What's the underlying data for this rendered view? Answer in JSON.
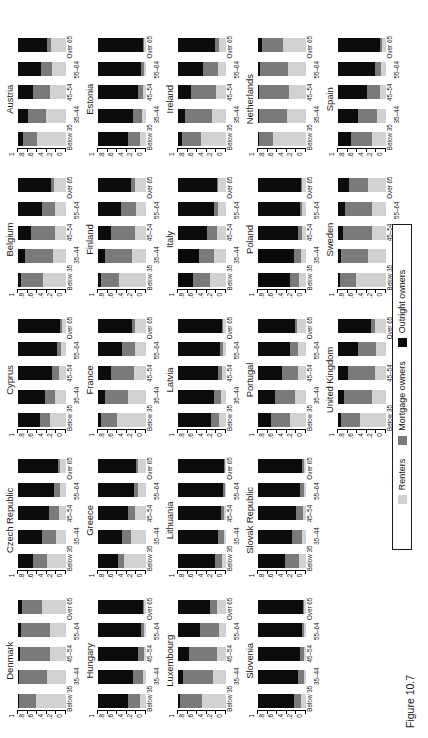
{
  "caption": "Figure 10.7",
  "legend": {
    "items": [
      {
        "label": "Renters",
        "color": "#d2d2d2",
        "key": "renters"
      },
      {
        "label": "Mortgage owners",
        "color": "#7a7a7a",
        "key": "mortgage"
      },
      {
        "label": "Outright owners",
        "color": "#0b0b0b",
        "key": "outright"
      }
    ]
  },
  "axes": {
    "y_ticks": [
      "0",
      ".2",
      ".4",
      ".6",
      ".8",
      "1"
    ],
    "y_min": 0,
    "y_max": 1,
    "x_categories": [
      "Below 35",
      "35–44",
      "45–54",
      "55–64",
      "Over 65"
    ]
  },
  "chart_data": {
    "type": "bar",
    "title": "Figure 10.7",
    "xlabel": "",
    "ylabel": "",
    "ylim": [
      0,
      1
    ],
    "grid": false,
    "legend_position": "bottom",
    "stacked": true,
    "small_multiples": true,
    "categories": [
      "Below 35",
      "35–44",
      "45–54",
      "55–64",
      "Over 65"
    ],
    "series_names": [
      "Renters",
      "Mortgage owners",
      "Outright owners"
    ],
    "panels": [
      {
        "country": "Denmark",
        "renters": [
          0.62,
          0.4,
          0.33,
          0.33,
          0.5
        ],
        "mortgage": [
          0.36,
          0.57,
          0.62,
          0.6,
          0.42
        ],
        "outright": [
          0.02,
          0.03,
          0.05,
          0.07,
          0.08
        ]
      },
      {
        "country": "Hungary",
        "renters": [
          0.12,
          0.07,
          0.05,
          0.04,
          0.04
        ],
        "mortgage": [
          0.25,
          0.2,
          0.12,
          0.07,
          0.03
        ],
        "outright": [
          0.63,
          0.73,
          0.83,
          0.89,
          0.93
        ]
      },
      {
        "country": "Luxembourg",
        "renters": [
          0.5,
          0.28,
          0.18,
          0.15,
          0.18
        ],
        "mortgage": [
          0.45,
          0.62,
          0.6,
          0.4,
          0.16
        ],
        "outright": [
          0.05,
          0.1,
          0.22,
          0.45,
          0.66
        ]
      },
      {
        "country": "Slovenia",
        "renters": [
          0.1,
          0.05,
          0.04,
          0.04,
          0.05
        ],
        "mortgage": [
          0.16,
          0.12,
          0.08,
          0.05,
          0.02
        ],
        "outright": [
          0.74,
          0.83,
          0.88,
          0.91,
          0.93
        ]
      },
      {
        "country": "",
        "empty": true
      },
      {
        "country": "Czech Republic",
        "renters": [
          0.4,
          0.2,
          0.14,
          0.12,
          0.12
        ],
        "mortgage": [
          0.28,
          0.3,
          0.22,
          0.13,
          0.05
        ],
        "outright": [
          0.32,
          0.5,
          0.64,
          0.75,
          0.83
        ]
      },
      {
        "country": "Greece",
        "renters": [
          0.46,
          0.32,
          0.22,
          0.16,
          0.16
        ],
        "mortgage": [
          0.12,
          0.18,
          0.16,
          0.1,
          0.04
        ],
        "outright": [
          0.42,
          0.5,
          0.62,
          0.74,
          0.8
        ]
      },
      {
        "country": "Lithuania",
        "renters": [
          0.08,
          0.05,
          0.04,
          0.03,
          0.03
        ],
        "mortgage": [
          0.14,
          0.12,
          0.07,
          0.04,
          0.02
        ],
        "outright": [
          0.78,
          0.83,
          0.89,
          0.93,
          0.95
        ]
      },
      {
        "country": "Slovak Republic",
        "renters": [
          0.14,
          0.08,
          0.06,
          0.05,
          0.05
        ],
        "mortgage": [
          0.3,
          0.22,
          0.14,
          0.07,
          0.03
        ],
        "outright": [
          0.56,
          0.7,
          0.8,
          0.88,
          0.92
        ]
      },
      {
        "country": "",
        "empty": true
      },
      {
        "country": "Cyprus",
        "renters": [
          0.34,
          0.22,
          0.14,
          0.1,
          0.08
        ],
        "mortgage": [
          0.2,
          0.22,
          0.16,
          0.09,
          0.04
        ],
        "outright": [
          0.46,
          0.56,
          0.7,
          0.81,
          0.88
        ]
      },
      {
        "country": "France",
        "renters": [
          0.6,
          0.38,
          0.26,
          0.22,
          0.22
        ],
        "mortgage": [
          0.33,
          0.47,
          0.46,
          0.28,
          0.08
        ],
        "outright": [
          0.07,
          0.15,
          0.28,
          0.5,
          0.7
        ]
      },
      {
        "country": "Latvia",
        "renters": [
          0.14,
          0.1,
          0.08,
          0.07,
          0.06
        ],
        "mortgage": [
          0.18,
          0.16,
          0.09,
          0.05,
          0.02
        ],
        "outright": [
          0.68,
          0.74,
          0.83,
          0.88,
          0.92
        ]
      },
      {
        "country": "Portugal",
        "renters": [
          0.34,
          0.22,
          0.17,
          0.16,
          0.18
        ],
        "mortgage": [
          0.4,
          0.42,
          0.33,
          0.18,
          0.06
        ],
        "outright": [
          0.26,
          0.36,
          0.5,
          0.66,
          0.76
        ]
      },
      {
        "country": "United Kingdom",
        "renters": [
          0.54,
          0.3,
          0.22,
          0.2,
          0.22
        ],
        "mortgage": [
          0.4,
          0.58,
          0.58,
          0.38,
          0.1
        ],
        "outright": [
          0.06,
          0.12,
          0.2,
          0.42,
          0.68
        ]
      },
      {
        "country": "Belgium",
        "renters": [
          0.48,
          0.28,
          0.22,
          0.22,
          0.24
        ],
        "mortgage": [
          0.45,
          0.58,
          0.5,
          0.28,
          0.08
        ],
        "outright": [
          0.07,
          0.14,
          0.28,
          0.5,
          0.68
        ]
      },
      {
        "country": "Finland",
        "renters": [
          0.56,
          0.3,
          0.22,
          0.2,
          0.22
        ],
        "mortgage": [
          0.38,
          0.55,
          0.52,
          0.33,
          0.1
        ],
        "outright": [
          0.06,
          0.15,
          0.26,
          0.47,
          0.68
        ]
      },
      {
        "country": "Italy",
        "renters": [
          0.34,
          0.24,
          0.18,
          0.16,
          0.16
        ],
        "mortgage": [
          0.34,
          0.32,
          0.22,
          0.1,
          0.03
        ],
        "outright": [
          0.32,
          0.44,
          0.6,
          0.74,
          0.81
        ]
      },
      {
        "country": "Poland",
        "renters": [
          0.14,
          0.1,
          0.08,
          0.08,
          0.08
        ],
        "mortgage": [
          0.2,
          0.14,
          0.08,
          0.04,
          0.02
        ],
        "outright": [
          0.66,
          0.76,
          0.84,
          0.88,
          0.9
        ]
      },
      {
        "country": "Sweden",
        "renters": [
          0.62,
          0.38,
          0.3,
          0.3,
          0.38
        ],
        "mortgage": [
          0.33,
          0.55,
          0.6,
          0.56,
          0.4
        ],
        "outright": [
          0.05,
          0.07,
          0.1,
          0.14,
          0.22
        ]
      },
      {
        "country": "Austria",
        "renters": [
          0.6,
          0.42,
          0.33,
          0.3,
          0.32
        ],
        "mortgage": [
          0.3,
          0.38,
          0.36,
          0.22,
          0.08
        ],
        "outright": [
          0.1,
          0.2,
          0.31,
          0.48,
          0.6
        ]
      },
      {
        "country": "Estonia",
        "renters": [
          0.12,
          0.08,
          0.06,
          0.05,
          0.05
        ],
        "mortgage": [
          0.26,
          0.2,
          0.11,
          0.05,
          0.02
        ],
        "outright": [
          0.62,
          0.72,
          0.83,
          0.9,
          0.93
        ]
      },
      {
        "country": "Ireland",
        "renters": [
          0.52,
          0.3,
          0.2,
          0.16,
          0.14
        ],
        "mortgage": [
          0.4,
          0.56,
          0.52,
          0.32,
          0.08
        ],
        "outright": [
          0.08,
          0.14,
          0.28,
          0.52,
          0.78
        ]
      },
      {
        "country": "Netherlands",
        "renters": [
          0.68,
          0.4,
          0.35,
          0.38,
          0.48
        ],
        "mortgage": [
          0.3,
          0.58,
          0.62,
          0.58,
          0.44
        ],
        "outright": [
          0.02,
          0.02,
          0.03,
          0.04,
          0.08
        ]
      },
      {
        "country": "Spain",
        "renters": [
          0.3,
          0.18,
          0.12,
          0.1,
          0.08
        ],
        "mortgage": [
          0.42,
          0.4,
          0.28,
          0.13,
          0.04
        ],
        "outright": [
          0.28,
          0.42,
          0.6,
          0.77,
          0.88
        ]
      }
    ]
  }
}
